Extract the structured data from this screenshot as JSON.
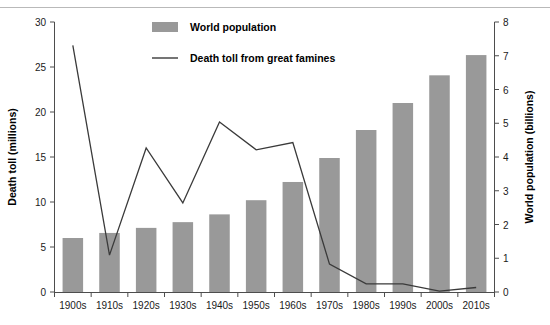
{
  "chart_data": {
    "type": "bar",
    "title": "",
    "subtitle": "",
    "xlabel": "",
    "categories": [
      "1900s",
      "1910s",
      "1920s",
      "1930s",
      "1940s",
      "1950s",
      "1960s",
      "1970s",
      "1980s",
      "1990s",
      "2000s",
      "2010s"
    ],
    "grid": false,
    "legend_position": "top-center",
    "axes": {
      "left": {
        "label": "Death toll (millions)",
        "min": 0,
        "max": 30,
        "step": 5,
        "ticks": [
          "0",
          "5",
          "10",
          "15",
          "20",
          "25",
          "30"
        ]
      },
      "right": {
        "label": "World population (billions)",
        "min": 0,
        "max": 8,
        "step": 1,
        "ticks": [
          "0",
          "1",
          "2",
          "3",
          "4",
          "5",
          "6",
          "7",
          "8"
        ]
      }
    },
    "series": [
      {
        "name": "World population",
        "render": "bar",
        "axis": "right",
        "unit": "billions",
        "color": "#999999",
        "values": [
          1.6,
          1.75,
          1.9,
          2.07,
          2.3,
          2.72,
          3.26,
          3.97,
          4.8,
          5.6,
          6.42,
          7.02
        ]
      },
      {
        "name": "Death toll from great famines",
        "render": "line",
        "axis": "left",
        "unit": "millions",
        "color": "#3a3a3a",
        "values": [
          27.4,
          4.1,
          16.0,
          9.9,
          18.9,
          15.8,
          16.6,
          3.1,
          0.9,
          0.9,
          0.1,
          0.5
        ]
      }
    ],
    "legend": [
      {
        "label": "World population",
        "marker": "bar-swatch",
        "color": "#999999"
      },
      {
        "label": "Death toll from great famines",
        "marker": "line-swatch",
        "color": "#3a3a3a"
      }
    ]
  }
}
